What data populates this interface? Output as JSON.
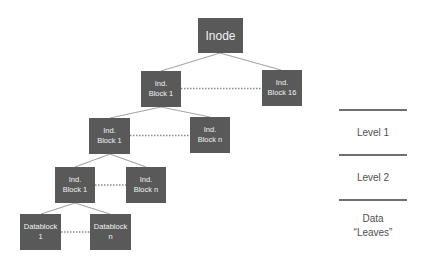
{
  "diagram": {
    "colors": {
      "box_fill": "#595959",
      "box_text": "#f2f2f2",
      "edge": "#a6a6a6",
      "sibling_dots": "#8c8c8c",
      "legend_line": "#6f6f6f",
      "legend_text": "#505050"
    },
    "nodes": [
      {
        "id": "inode",
        "lines": [
          "Inode"
        ],
        "x": 198,
        "y": 18,
        "w": 45,
        "h": 35,
        "big": true
      },
      {
        "id": "l1-block-1",
        "lines": [
          "Ind.",
          "Block 1"
        ],
        "x": 141,
        "y": 71,
        "w": 40,
        "h": 36
      },
      {
        "id": "l1-block-16",
        "lines": [
          "Ind.",
          "Block 16"
        ],
        "x": 262,
        "y": 70,
        "w": 40,
        "h": 36
      },
      {
        "id": "l2-block-1",
        "lines": [
          "Ind.",
          "Block 1"
        ],
        "x": 89,
        "y": 118,
        "w": 41,
        "h": 36
      },
      {
        "id": "l2-block-n",
        "lines": [
          "Ind.",
          "Block n"
        ],
        "x": 190,
        "y": 117,
        "w": 40,
        "h": 36
      },
      {
        "id": "l3-block-1",
        "lines": [
          "Ind.",
          "Block 1"
        ],
        "x": 55,
        "y": 167,
        "w": 40,
        "h": 36
      },
      {
        "id": "l3-block-n",
        "lines": [
          "Ind.",
          "Block n"
        ],
        "x": 126,
        "y": 167,
        "w": 40,
        "h": 36
      },
      {
        "id": "datablock-1",
        "lines": [
          "Datablock",
          "1"
        ],
        "x": 20,
        "y": 214,
        "w": 41,
        "h": 36
      },
      {
        "id": "datablock-n",
        "lines": [
          "Datablock",
          "n"
        ],
        "x": 90,
        "y": 214,
        "w": 41,
        "h": 36
      }
    ],
    "edges": [
      {
        "from": [
          220,
          53
        ],
        "to": [
          161,
          71
        ]
      },
      {
        "from": [
          220,
          53
        ],
        "to": [
          281,
          70
        ]
      },
      {
        "from": [
          161,
          107
        ],
        "to": [
          110,
          118
        ]
      },
      {
        "from": [
          161,
          107
        ],
        "to": [
          210,
          117
        ]
      },
      {
        "from": [
          110,
          154
        ],
        "to": [
          75,
          167
        ]
      },
      {
        "from": [
          110,
          154
        ],
        "to": [
          146,
          167
        ]
      },
      {
        "from": [
          75,
          203
        ],
        "to": [
          41,
          214
        ]
      },
      {
        "from": [
          75,
          203
        ],
        "to": [
          110,
          214
        ]
      }
    ],
    "sibling_links": [
      {
        "x1": 181,
        "x2": 262,
        "y": 88.5
      },
      {
        "x1": 130,
        "x2": 190,
        "y": 135.5
      },
      {
        "x1": 95,
        "x2": 126,
        "y": 185
      },
      {
        "x1": 61,
        "x2": 90,
        "y": 232
      }
    ]
  },
  "legend": {
    "lines_y": [
      110,
      155,
      200
    ],
    "line_x": 339,
    "line_w": 68,
    "labels": [
      {
        "text": "Level 1",
        "y": 127
      },
      {
        "text": "Level 2",
        "y": 172
      },
      {
        "text": "Data",
        "y": 213
      },
      {
        "text": "“Leaves”",
        "y": 227
      }
    ]
  }
}
